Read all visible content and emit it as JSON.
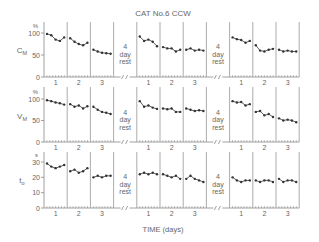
{
  "chart_data": {
    "type": "line",
    "title": "CAT No.6 CCW",
    "xlabel": "TIME (days)",
    "layout": {
      "blocks": 3,
      "days_per_block": [
        1,
        2,
        3
      ],
      "rest_label": [
        "4",
        "day",
        "rest"
      ],
      "rest_between_blocks": true,
      "grid": false
    },
    "x_tick_labels": [
      "1",
      "2",
      "3"
    ],
    "panels": [
      {
        "id": "cm",
        "ylabel": "C_M",
        "ylabel_main": "C",
        "ylabel_sub": "M",
        "unit": "%",
        "yticks": [
          0,
          50,
          100
        ],
        "ylim": [
          0,
          100
        ],
        "blocks": [
          [
            [
              98,
              95,
              85,
              82,
              90
            ],
            [
              88,
              80,
              75,
              72,
              78
            ],
            [
              62,
              58,
              55,
              54,
              53
            ]
          ],
          [
            [
              92,
              82,
              85,
              80,
              70
            ],
            [
              68,
              65,
              65,
              58,
              62
            ],
            [
              62,
              65,
              60,
              62,
              60
            ]
          ],
          [
            [
              90,
              86,
              84,
              78,
              82
            ],
            [
              72,
              60,
              58,
              62,
              64
            ],
            [
              62,
              58,
              60,
              58,
              58
            ]
          ]
        ]
      },
      {
        "id": "vm",
        "ylabel": "V_M",
        "ylabel_main": "V",
        "ylabel_sub": "M",
        "unit": "%",
        "yticks": [
          0,
          50,
          100
        ],
        "ylim": [
          0,
          100
        ],
        "blocks": [
          [
            [
              97,
              95,
              92,
              90,
              87
            ],
            [
              88,
              82,
              85,
              78,
              83
            ],
            [
              82,
              75,
              70,
              68,
              65
            ]
          ],
          [
            [
              95,
              82,
              85,
              80,
              77
            ],
            [
              78,
              76,
              78,
              70,
              70
            ],
            [
              78,
              75,
              72,
              74,
              72
            ]
          ],
          [
            [
              95,
              92,
              93,
              85,
              88
            ],
            [
              70,
              72,
              62,
              65,
              58
            ],
            [
              55,
              50,
              52,
              50,
              46
            ]
          ]
        ]
      },
      {
        "id": "to",
        "ylabel": "t_o",
        "ylabel_main": "t",
        "ylabel_sub": "o",
        "unit": "s",
        "yticks": [
          0,
          10,
          20,
          30
        ],
        "ylim": [
          0,
          30
        ],
        "blocks": [
          [
            [
              29,
              27,
              26,
              27,
              28
            ],
            [
              24,
              25,
              23,
              24,
              26
            ],
            [
              20,
              21,
              20,
              21,
              21
            ]
          ],
          [
            [
              22,
              23,
              22,
              23,
              22
            ],
            [
              22,
              21,
              20,
              21,
              19
            ],
            [
              19,
              21,
              19,
              18,
              17
            ]
          ],
          [
            [
              20,
              18,
              17,
              18,
              18
            ],
            [
              18,
              17,
              18,
              18,
              17
            ],
            [
              19,
              17,
              18,
              18,
              17
            ]
          ]
        ]
      }
    ]
  },
  "colors": {
    "line": "#333333",
    "axis": "#888888",
    "text": "#666666"
  }
}
